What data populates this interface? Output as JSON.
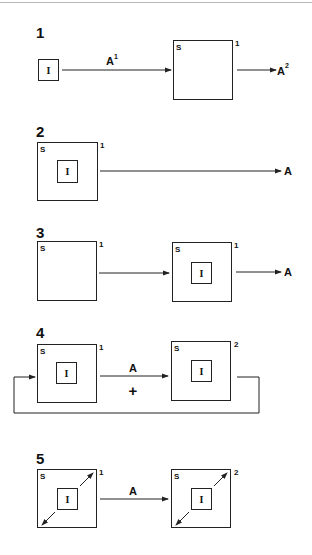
{
  "panels": [
    {
      "number": "1",
      "input_box_label": "I",
      "system_box": {
        "label": "S",
        "index": "1"
      },
      "arrow_in_label": "A",
      "arrow_in_sup": "1",
      "arrow_out_label": "A",
      "arrow_out_sup": "2"
    },
    {
      "number": "2",
      "system_box": {
        "label": "S",
        "index": "1",
        "inner": "I"
      },
      "arrow_out_label": "A"
    },
    {
      "number": "3",
      "system_box_left": {
        "label": "S",
        "index": "1"
      },
      "system_box_right": {
        "label": "S",
        "index": "1",
        "inner": "I"
      },
      "arrow_out_label": "A"
    },
    {
      "number": "4",
      "system_box_left": {
        "label": "S",
        "index": "1",
        "inner": "I"
      },
      "system_box_right": {
        "label": "S",
        "index": "2",
        "inner": "I"
      },
      "arrow_label": "A",
      "operator": "+",
      "feedback_loop": true
    },
    {
      "number": "5",
      "system_box_left": {
        "label": "S",
        "index": "1",
        "inner": "I"
      },
      "system_box_right": {
        "label": "S",
        "index": "2",
        "inner": "I"
      },
      "arrow_label": "A",
      "diagonal_arrows": true
    }
  ]
}
